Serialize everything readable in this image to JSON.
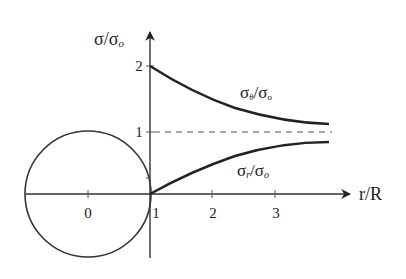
{
  "diagram": {
    "y_axis": {
      "label_main": "σ/σ",
      "label_sub": "o",
      "ticks": [
        {
          "value": 1,
          "label": "1"
        },
        {
          "value": 2,
          "label": "2"
        }
      ]
    },
    "x_axis": {
      "label": "r/R",
      "ticks": [
        {
          "value": 0,
          "label": "0"
        },
        {
          "value": 1,
          "label": "1"
        },
        {
          "value": 2,
          "label": "2"
        },
        {
          "value": 3,
          "label": "3"
        }
      ]
    },
    "curves": [
      {
        "name": "hoop-stress",
        "label_main": "σ",
        "label_sub1": "θ",
        "label_mid": "/σ",
        "label_sub2": "o",
        "formula": "1 + 1/(r/R)^2"
      },
      {
        "name": "radial-stress",
        "label_main": "σ",
        "label_sub1": "r",
        "label_mid": "/σ",
        "label_sub2": "o",
        "formula": "1 - 1/(r/R)^2"
      }
    ],
    "reference_line": {
      "value": 1,
      "style": "dashed"
    },
    "hole": {
      "center_r": 0,
      "radius": 1
    },
    "colors": {
      "line": "#222222",
      "dashed": "#555555"
    }
  }
}
